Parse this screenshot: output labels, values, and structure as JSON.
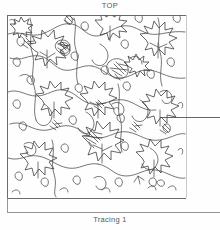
{
  "page": {
    "top_label": "TOP",
    "bottom_label": "Tracing 1",
    "background_color": "#fefefe",
    "ink_color": "#3f3f3f",
    "frame_color": "#6b6b6b"
  },
  "drawing": {
    "title": "Tracing 1",
    "orientation_marker": "TOP",
    "subject": "hand-drawn leaf and vine quilting pattern",
    "frame": {
      "left": 7,
      "top": 15,
      "right": 186,
      "bottom": 198
    },
    "pointer_line": {
      "y": 117,
      "x_start": 160,
      "x_end": 220
    },
    "bottom_rule": {
      "y": 212,
      "x_start": 7,
      "x_end": 220
    },
    "motifs": [
      "maple-leaf",
      "vine-scroll",
      "tendril-curl",
      "berry-bud",
      "flower-cluster"
    ]
  }
}
